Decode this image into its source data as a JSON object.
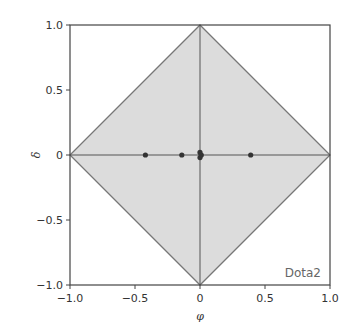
{
  "chart_data": {
    "type": "scatter",
    "title": "",
    "xlabel": "φ",
    "ylabel": "δ",
    "xlim": [
      -1.0,
      1.0
    ],
    "ylim": [
      -1.0,
      1.0
    ],
    "xticks": [
      "−1.0",
      "−0.5",
      "0",
      "0.5",
      "1.0"
    ],
    "yticks": [
      "−1.0",
      "−0.5",
      "0",
      "0.5",
      "1.0"
    ],
    "grid": false,
    "annotation": "Dota2",
    "region": {
      "shape": "diamond",
      "vertices": [
        [
          0,
          1
        ],
        [
          1,
          0
        ],
        [
          0,
          -1
        ],
        [
          -1,
          0
        ]
      ],
      "fill": "#dcdcdc",
      "edge": "#777777"
    },
    "reference_lines": [
      {
        "orientation": "horizontal",
        "value": 0
      },
      {
        "orientation": "vertical",
        "value": 0
      }
    ],
    "series": [
      {
        "name": "points",
        "color": "#333333",
        "x": [
          -0.42,
          -0.14,
          0.0,
          0.0,
          0.01,
          0.39
        ],
        "y": [
          0.0,
          0.0,
          0.02,
          -0.02,
          0.0,
          0.0
        ]
      }
    ]
  }
}
